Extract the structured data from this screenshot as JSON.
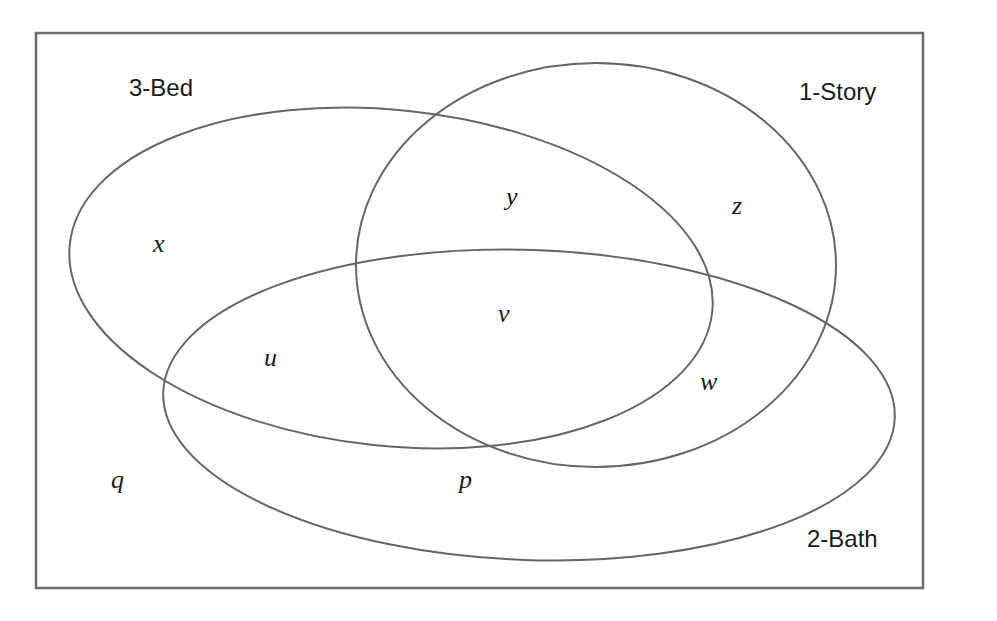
{
  "diagram": {
    "type": "venn",
    "colors": {
      "stroke": "#666666",
      "text": "#1a1a1a",
      "background": "#ffffff"
    },
    "sets": [
      {
        "name": "3-Bed",
        "label": "3-Bed"
      },
      {
        "name": "1-Story",
        "label": "1-Story"
      },
      {
        "name": "2-Bath",
        "label": "2-Bath"
      }
    ],
    "regions": [
      {
        "label": "x",
        "membership": [
          "3-Bed"
        ]
      },
      {
        "label": "y",
        "membership": [
          "3-Bed",
          "1-Story"
        ]
      },
      {
        "label": "z",
        "membership": [
          "1-Story"
        ]
      },
      {
        "label": "v",
        "membership": [
          "3-Bed",
          "1-Story",
          "2-Bath"
        ]
      },
      {
        "label": "u",
        "membership": [
          "3-Bed",
          "2-Bath"
        ]
      },
      {
        "label": "w",
        "membership": [
          "1-Story",
          "2-Bath"
        ]
      },
      {
        "label": "p",
        "membership": [
          "2-Bath"
        ]
      },
      {
        "label": "q",
        "membership": []
      }
    ]
  }
}
